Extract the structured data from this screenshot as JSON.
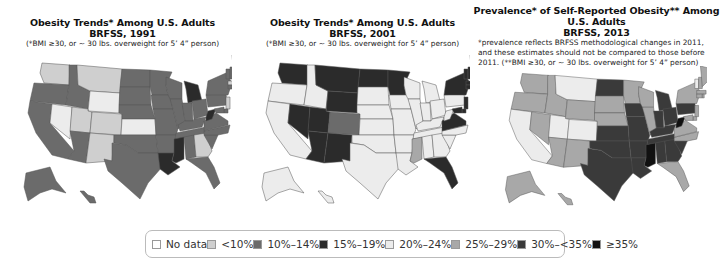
{
  "colors": {
    "no_data": "#ffffff",
    "lt10": "#cfcfcf",
    "p10_14": "#6b6b6b",
    "p15_19": "#2b2b2b",
    "p20_24": "#ececec",
    "p25_29": "#a8a8a8",
    "p30_35": "#3a3a3a",
    "ge35": "#111111",
    "border": "#888888"
  },
  "maps": [
    {
      "id": "1991",
      "title": "Obesity Trends* Among U.S. Adults",
      "subtitle": "BRFSS, 1991",
      "note": "(*BMI ≥30, or ~ 30 lbs. overweight for 5’ 4” person)"
    },
    {
      "id": "2001",
      "title": "Obesity Trends* Among U.S. Adults",
      "subtitle": "BRFSS, 2001",
      "note": "(*BMI ≥30, or ~ 30 lbs. overweight for 5’ 4” person)"
    },
    {
      "id": "2013",
      "title": "Prevalence* of Self-Reported Obesity** Among U.S. Adults",
      "subtitle": "BRFSS, 2013",
      "note_lines": [
        "*prevalence reflects BRFSS methodological changes in 2011,",
        "and these estimates should not be compared to those before",
        "2011. (**BMI ≥30, or ~ 30 lbs. overweight for 5’ 4” person)"
      ]
    }
  ],
  "legend": {
    "items": [
      {
        "label": "No data",
        "key": "no_data"
      },
      {
        "label": "<10%",
        "key": "lt10"
      },
      {
        "label": "10%–14%",
        "key": "p10_14"
      },
      {
        "label": "15%–19%",
        "key": "p15_19"
      },
      {
        "label": "20%–24%",
        "key": "p20_24"
      },
      {
        "label": "25%–29%",
        "key": "p25_29"
      },
      {
        "label": "30%–<35%",
        "key": "p30_35"
      },
      {
        "label": "≥35%",
        "key": "ge35"
      }
    ]
  }
}
